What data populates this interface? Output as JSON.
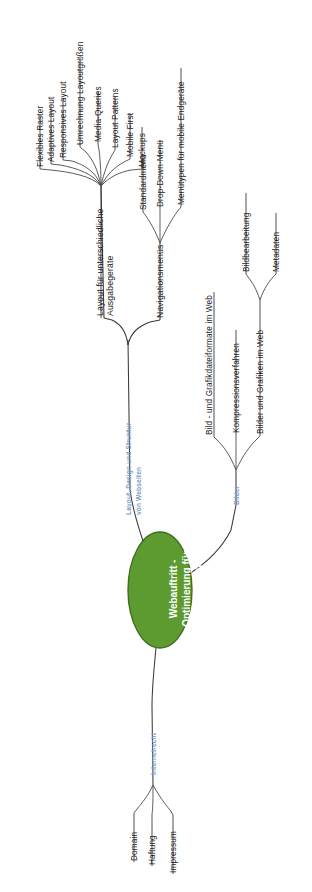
{
  "diagram": {
    "type": "mind-map",
    "orientation": "rotated-90-ccw",
    "colors": {
      "center_fill": "#5d9b31",
      "center_stroke": "#3f6f1f",
      "center_text": "#ffffff",
      "branch_label": "#7d9bc4",
      "node_text": "#1c1c1c",
      "edge": "#3a3a3a",
      "background": "#ffffff"
    },
    "center": {
      "label": "Webauftritt - Optimierung für Desktop und Smartphone"
    },
    "branches": [
      {
        "label": "Layout, Design und Struktur von Webseiten",
        "style": "blue",
        "children": [
          {
            "label": "Layout für unterschiedliche Ausgabegeräte",
            "children": [
              {
                "label": "Flexibles Raster"
              },
              {
                "label": "Adaptives Layout"
              },
              {
                "label": "Responsives Layout"
              },
              {
                "label": "Umrechnung Layoutgrößen"
              },
              {
                "label": "Media-Queries"
              },
              {
                "label": "Layout Patterns"
              },
              {
                "label": "Mobile First"
              },
              {
                "label": "Mockups"
              }
            ]
          },
          {
            "label": "Navigationsmenüs",
            "children": [
              {
                "label": "Standardmenü"
              },
              {
                "label": "Drop-Down-Menü"
              },
              {
                "label": "Menütypen für mobile Endgeräte"
              }
            ]
          }
        ]
      },
      {
        "label": "Bilder",
        "style": "blue",
        "children": [
          {
            "label": "Bild - und Grafikdateiformate im Web"
          },
          {
            "label": "Kompressionsverfahren"
          },
          {
            "label": "Bilder und Grafiken im Web",
            "children": [
              {
                "label": "Bildbearbeitung"
              },
              {
                "label": "Metadaten"
              }
            ]
          }
        ]
      },
      {
        "label": "Internetrecht",
        "style": "blue",
        "children": [
          {
            "label": "Domain"
          },
          {
            "label": "Haftung"
          },
          {
            "label": "Impressum"
          }
        ]
      }
    ]
  }
}
